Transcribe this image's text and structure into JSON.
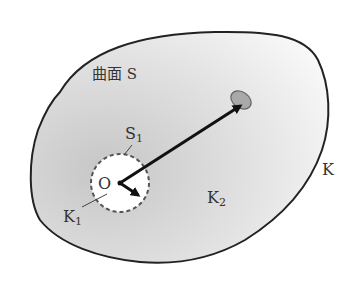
{
  "diagram": {
    "labels": {
      "surface": "曲面 S",
      "inner_surface": "S",
      "inner_surface_sub": "1",
      "origin": "O",
      "inner_region": "K",
      "inner_region_sub": "1",
      "outer_region": "K",
      "outer_region_sub": "2",
      "whole_region": "K"
    },
    "colors": {
      "outline": "#222222",
      "fill_dark": "#c8c8c8",
      "fill_light": "#f6f6f6",
      "blob_fill": "#a9a9a9",
      "arrow": "#111111",
      "dashed_circle": "#555555"
    }
  }
}
